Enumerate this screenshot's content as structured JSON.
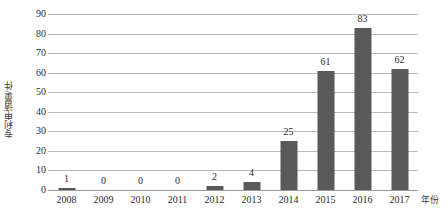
{
  "chart_data": {
    "type": "bar",
    "title": "",
    "subtitle": "",
    "xlabel": "年份",
    "ylabel": "专利申请量/件",
    "categories": [
      "2008",
      "2009",
      "2010",
      "2011",
      "2012",
      "2013",
      "2014",
      "2015",
      "2016",
      "2017"
    ],
    "values": [
      1,
      0,
      0,
      0,
      2,
      4,
      25,
      61,
      83,
      62
    ],
    "data_labels": [
      "1",
      "0",
      "0",
      "0",
      "2",
      "4",
      "25",
      "61",
      "83",
      "62"
    ],
    "ylim": [
      0,
      90
    ],
    "ytick_values": [
      0,
      10,
      20,
      30,
      40,
      50,
      60,
      70,
      80,
      90
    ],
    "ytick_labels": [
      "0",
      "10",
      "20",
      "30",
      "40",
      "50",
      "60",
      "70",
      "80",
      "90"
    ],
    "grid": true,
    "grid_axis": "y",
    "legend": false,
    "legend_position": "none",
    "series": [
      {
        "name": "专利申请量",
        "color": "#595959",
        "values": [
          1,
          0,
          0,
          0,
          2,
          4,
          25,
          61,
          83,
          62
        ]
      }
    ],
    "colors": {
      "bar": "#595959",
      "gridline": "#b9b9b9",
      "axis": "#9a9a9a",
      "text": "#2b2b2b",
      "background": "#ffffff"
    }
  }
}
